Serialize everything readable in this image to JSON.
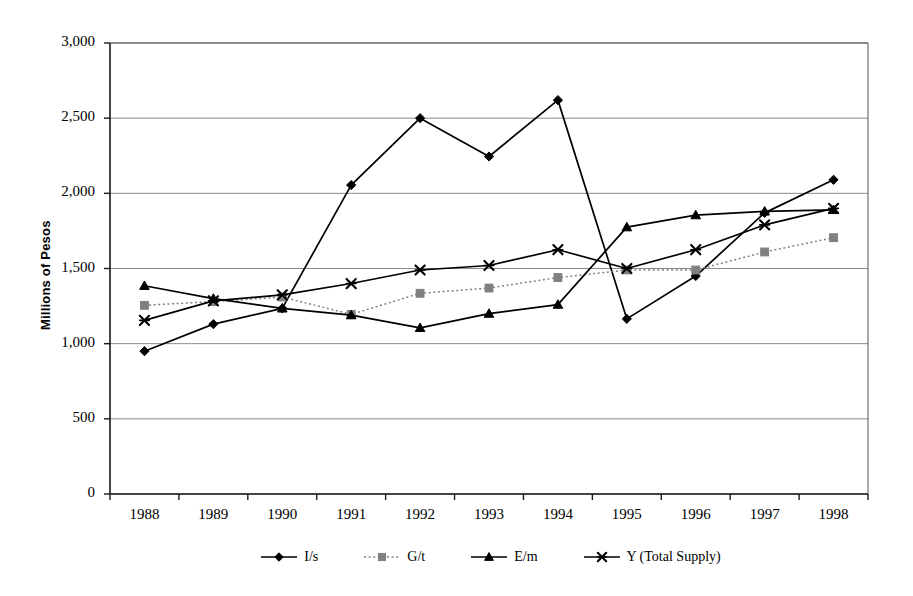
{
  "chart_data": {
    "type": "line",
    "title": "",
    "xlabel": "",
    "ylabel": "Millions of Pesos",
    "categories": [
      "1988",
      "1989",
      "1990",
      "1991",
      "1992",
      "1993",
      "1994",
      "1995",
      "1996",
      "1997",
      "1998"
    ],
    "ylim": [
      0,
      3000
    ],
    "yticks": [
      0,
      500,
      1000,
      1500,
      2000,
      2500,
      3000
    ],
    "ytick_labels": [
      "0",
      "500",
      "1,000",
      "1,500",
      "2,000",
      "2,500",
      "3,000"
    ],
    "grid": "horizontal",
    "legend_position": "bottom",
    "series": [
      {
        "name": "I/s",
        "marker": "diamond",
        "line_style": "solid",
        "color": "#000000",
        "values": [
          950,
          1130,
          1235,
          2055,
          2500,
          2245,
          2620,
          1165,
          1450,
          1870,
          2090
        ]
      },
      {
        "name": "G/t",
        "marker": "square",
        "line_style": "dotted",
        "color": "#808080",
        "values": [
          1255,
          1280,
          1310,
          1195,
          1335,
          1370,
          1440,
          1490,
          1490,
          1610,
          1705
        ]
      },
      {
        "name": "E/m",
        "marker": "triangle",
        "line_style": "solid",
        "color": "#000000",
        "values": [
          1385,
          1300,
          1235,
          1190,
          1105,
          1200,
          1260,
          1775,
          1855,
          1880,
          1890
        ]
      },
      {
        "name": "Y (Total Supply)",
        "marker": "x",
        "line_style": "solid",
        "color": "#000000",
        "values": [
          1155,
          1285,
          1325,
          1400,
          1490,
          1520,
          1625,
          1500,
          1625,
          1790,
          1900
        ]
      }
    ]
  },
  "axes": {
    "y_axis_title": "Millions of Pesos"
  }
}
